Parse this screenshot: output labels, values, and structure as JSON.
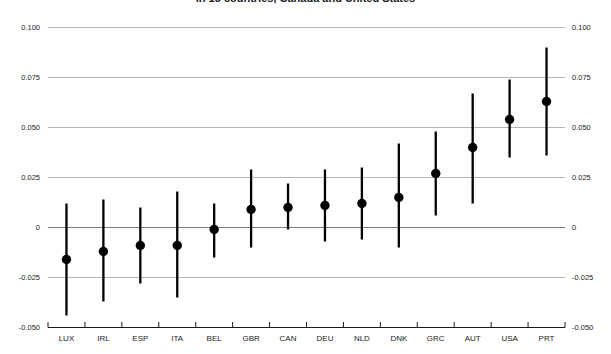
{
  "page": {
    "background": "#ffffff"
  },
  "chart_data": {
    "type": "scatter",
    "subtype": "dot-and-whisker",
    "title": "in 15 countries, Canada and United States",
    "categories": [
      "LUX",
      "IRL",
      "ESP",
      "ITA",
      "BEL",
      "GBR",
      "CAN",
      "DEU",
      "NLD",
      "DNK",
      "GRC",
      "AUT",
      "USA",
      "PRT"
    ],
    "series": [
      {
        "name": "estimate",
        "values": [
          -0.016,
          -0.012,
          -0.009,
          -0.009,
          -0.001,
          0.009,
          0.01,
          0.011,
          0.012,
          0.015,
          0.027,
          0.04,
          0.054,
          0.063
        ]
      },
      {
        "name": "ci_lower",
        "values": [
          -0.044,
          -0.037,
          -0.028,
          -0.035,
          -0.015,
          -0.01,
          -0.001,
          -0.007,
          -0.006,
          -0.01,
          0.006,
          0.012,
          0.035,
          0.036
        ]
      },
      {
        "name": "ci_upper",
        "values": [
          0.012,
          0.014,
          0.01,
          0.018,
          0.012,
          0.029,
          0.022,
          0.029,
          0.03,
          0.042,
          0.048,
          0.067,
          0.074,
          0.09
        ]
      }
    ],
    "xlabel": "",
    "ylabel": "",
    "ylim": [
      -0.05,
      0.1
    ],
    "yticks": [
      0.1,
      0.075,
      0.05,
      0.025,
      0,
      -0.025,
      -0.05
    ],
    "ytick_labels": [
      "0.100",
      "0.075",
      "0.050",
      "0.025",
      "0",
      "-0.025",
      "-0.050"
    ],
    "y_axis_labels_sides": "both",
    "grid": true,
    "legend": "none",
    "colors": {
      "point": "#000000",
      "whisker": "#000000",
      "gridline": "#b3b3b3",
      "zero_line": "#7d7d7d",
      "axis": "#1a1a1a",
      "label": "#1a1a1a"
    }
  }
}
